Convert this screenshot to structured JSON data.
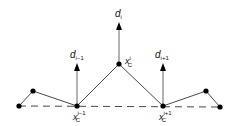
{
  "diagram": {
    "nodes": [
      {
        "id": "left-end"
      },
      {
        "id": "left-peak"
      },
      {
        "id": "xc-im1",
        "label": "x",
        "sub": "C",
        "sup": "i−1"
      },
      {
        "id": "xc-i",
        "label": "x",
        "sub": "C",
        "sup": "i"
      },
      {
        "id": "xc-ip1",
        "label": "x",
        "sub": "C",
        "sup": "i+1"
      },
      {
        "id": "right-peak"
      },
      {
        "id": "right-end"
      }
    ],
    "vectors": [
      {
        "id": "d-im1",
        "label": "d",
        "sub": "i−1"
      },
      {
        "id": "d-i",
        "label": "d",
        "sub": "i"
      },
      {
        "id": "d-ip1",
        "label": "d",
        "sub": "i+1"
      }
    ],
    "colors": {
      "line": "#333333",
      "arrow": "#555555",
      "node": "#000000"
    }
  }
}
